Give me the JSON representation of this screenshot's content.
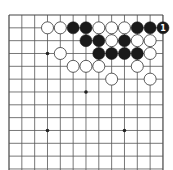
{
  "board": {
    "size": 13,
    "visible_cols": [
      0,
      12
    ],
    "visible_rows": [
      0,
      12
    ],
    "origin_x": 9,
    "origin_y": 15,
    "spacing": 12.83,
    "line_color": "#555555",
    "edge_color": "#444444",
    "star_points": [
      [
        3,
        3
      ],
      [
        6,
        6
      ],
      [
        3,
        9
      ],
      [
        9,
        9
      ],
      [
        9,
        3
      ],
      [
        3,
        6
      ],
      [
        9,
        6
      ],
      [
        6,
        3
      ],
      [
        6,
        9
      ]
    ],
    "visible_star_points": [
      [
        3,
        3
      ],
      [
        6,
        6
      ],
      [
        3,
        9
      ],
      [
        9,
        9
      ]
    ]
  },
  "stones": [
    {
      "col": 3,
      "row": 1,
      "color": "white"
    },
    {
      "col": 4,
      "row": 1,
      "color": "white"
    },
    {
      "col": 5,
      "row": 1,
      "color": "black"
    },
    {
      "col": 6,
      "row": 1,
      "color": "black"
    },
    {
      "col": 7,
      "row": 1,
      "color": "white"
    },
    {
      "col": 8,
      "row": 1,
      "color": "white"
    },
    {
      "col": 9,
      "row": 1,
      "color": "white"
    },
    {
      "col": 10,
      "row": 1,
      "color": "black"
    },
    {
      "col": 11,
      "row": 1,
      "color": "black"
    },
    {
      "col": 12,
      "row": 1,
      "color": "black",
      "label": "1"
    },
    {
      "col": 6,
      "row": 2,
      "color": "black"
    },
    {
      "col": 7,
      "row": 2,
      "color": "black"
    },
    {
      "col": 8,
      "row": 2,
      "color": "white"
    },
    {
      "col": 9,
      "row": 2,
      "color": "black"
    },
    {
      "col": 10,
      "row": 2,
      "color": "white"
    },
    {
      "col": 11,
      "row": 2,
      "color": "white"
    },
    {
      "col": 4,
      "row": 3,
      "color": "white"
    },
    {
      "col": 7,
      "row": 3,
      "color": "black"
    },
    {
      "col": 8,
      "row": 3,
      "color": "black"
    },
    {
      "col": 9,
      "row": 3,
      "color": "black"
    },
    {
      "col": 10,
      "row": 3,
      "color": "black"
    },
    {
      "col": 11,
      "row": 3,
      "color": "white"
    },
    {
      "col": 5,
      "row": 4,
      "color": "white"
    },
    {
      "col": 6,
      "row": 4,
      "color": "white"
    },
    {
      "col": 7,
      "row": 4,
      "color": "white"
    },
    {
      "col": 10,
      "row": 4,
      "color": "white"
    },
    {
      "col": 8,
      "row": 5,
      "color": "white"
    },
    {
      "col": 11,
      "row": 5,
      "color": "white"
    }
  ],
  "move_labels": [
    {
      "col": 12,
      "row": 1,
      "text": "1",
      "color": "#ffffff"
    }
  ],
  "colors": {
    "black_stone": "#1a1a1a",
    "white_stone": "#ffffff",
    "white_stone_stroke": "#333333",
    "label_on_black": "#ffffff",
    "background": "#ffffff"
  }
}
